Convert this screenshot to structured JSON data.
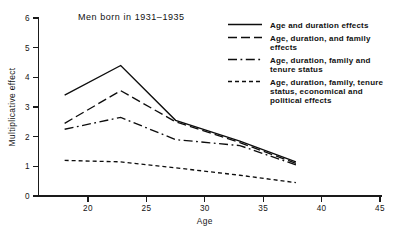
{
  "chart_data": {
    "type": "line",
    "title": "Men born in 1931–1935",
    "xlabel": "Age",
    "ylabel": "Multiplicative effect",
    "xlim": [
      17,
      45
    ],
    "ylim": [
      0,
      6
    ],
    "xticks": [
      "20",
      "25",
      "30",
      "35",
      "40",
      "45"
    ],
    "xtick_values": [
      20,
      25,
      30,
      35,
      40,
      45
    ],
    "yticks": [
      "0",
      "1",
      "2",
      "3",
      "4",
      "5",
      "6"
    ],
    "ytick_values": [
      0,
      1,
      2,
      3,
      4,
      5,
      6
    ],
    "grid": false,
    "legend_position": "top-right",
    "x": [
      18,
      22.8,
      27.5,
      33,
      37.8
    ],
    "series": [
      {
        "name": "Age and duration effects",
        "style": "solid",
        "values": [
          3.4,
          4.4,
          2.55,
          1.85,
          1.15
        ]
      },
      {
        "name": "Age, duration, and family effects",
        "style": "long-dash",
        "values": [
          2.45,
          3.55,
          2.5,
          1.8,
          1.1
        ]
      },
      {
        "name": "Age, duration, family and tenure status",
        "style": "dash-dot",
        "values": [
          2.25,
          2.65,
          1.9,
          1.7,
          1.05
        ]
      },
      {
        "name": "Age, duration, family, tenure status, economical and political effects",
        "style": "short-dash",
        "values": [
          1.2,
          1.15,
          0.95,
          0.7,
          0.45
        ]
      }
    ]
  },
  "legend": {
    "entries": [
      {
        "line1": "Age and duration effects",
        "line2": "",
        "line3": ""
      },
      {
        "line1": "Age, duration, and family",
        "line2": "effects",
        "line3": ""
      },
      {
        "line1": "Age, duration, family and",
        "line2": "tenure status",
        "line3": ""
      },
      {
        "line1": "Age, duration, family, tenure",
        "line2": "status, economical and",
        "line3": "political effects"
      }
    ]
  },
  "axes": {
    "x_title": "Age",
    "y_title": "Multiplicative effect",
    "x_tick_labels": [
      "20",
      "25",
      "30",
      "35",
      "40",
      "45"
    ],
    "y_tick_labels": [
      "0",
      "1",
      "2",
      "3",
      "4",
      "5",
      "6"
    ]
  },
  "colors": {
    "ink": "#0d0d0d",
    "background": "#ffffff"
  }
}
